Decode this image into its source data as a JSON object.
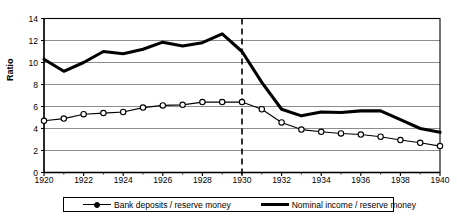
{
  "chart_data": {
    "type": "line",
    "title": "",
    "xlabel": "",
    "ylabel": "Ratio",
    "xlim": [
      1920,
      1940
    ],
    "ylim": [
      0,
      14
    ],
    "ytick_step": 2,
    "xtick_step": 2,
    "grid": "horizontal",
    "legend_position": "bottom",
    "x": [
      1920,
      1921,
      1922,
      1923,
      1924,
      1925,
      1926,
      1927,
      1928,
      1929,
      1930,
      1931,
      1932,
      1933,
      1934,
      1935,
      1936,
      1937,
      1938,
      1939,
      1940
    ],
    "series": [
      {
        "name": "Bank deposits / reserve money",
        "style": "thin-with-circle-markers",
        "values": [
          4.7,
          4.9,
          5.3,
          5.4,
          5.5,
          5.9,
          6.1,
          6.15,
          6.4,
          6.4,
          6.4,
          5.75,
          4.55,
          3.9,
          3.7,
          3.55,
          3.45,
          3.25,
          2.95,
          2.7,
          2.4
        ]
      },
      {
        "name": "Nominal income / reserve money",
        "style": "thick-line",
        "values": [
          10.3,
          9.2,
          10.0,
          11.0,
          10.8,
          11.2,
          11.85,
          11.5,
          11.8,
          12.6,
          11.0,
          8.2,
          5.75,
          5.15,
          5.5,
          5.45,
          5.6,
          5.6,
          4.8,
          4.0,
          3.65
        ]
      }
    ],
    "annotations": [
      {
        "type": "vertical-dashed-line",
        "x": 1930,
        "label": ""
      }
    ],
    "yticks": [
      "0",
      "2",
      "4",
      "6",
      "8",
      "10",
      "12",
      "14"
    ],
    "xticks": [
      "1920",
      "1922",
      "1924",
      "1926",
      "1928",
      "1930",
      "1932",
      "1934",
      "1936",
      "1938",
      "1940"
    ]
  },
  "colors": {
    "axis": "#000000",
    "grid": "#808080",
    "series1": "#000000",
    "series2": "#000000",
    "marker_fill": "#ffffff",
    "background": "#ffffff"
  },
  "legend": {
    "items": [
      {
        "label": "Bank deposits / reserve money"
      },
      {
        "label": "Nominal income / reserve money"
      }
    ]
  }
}
